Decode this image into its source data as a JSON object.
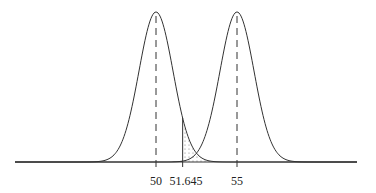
{
  "chart_data": {
    "type": "line",
    "title": "",
    "xlabel": "",
    "ylabel": "",
    "series": [
      {
        "name": "H0 distribution",
        "mean": 50,
        "sd": 1
      },
      {
        "name": "H1 distribution",
        "mean": 55,
        "sd": 1
      }
    ],
    "critical_value": 51.645,
    "tick_labels": [
      "50",
      "51.645",
      "55"
    ],
    "shaded_regions": [
      {
        "name": "alpha (right tail of H0 beyond 51.645)",
        "fill": "dotted"
      },
      {
        "name": "beta (left tail of H1 below 51.645)",
        "fill": "solid black"
      }
    ],
    "vertical_dashed_lines_at": [
      50,
      55
    ],
    "grid": false
  },
  "labels": {
    "mean0": "50",
    "critical": "51.645",
    "mean1": "55"
  }
}
